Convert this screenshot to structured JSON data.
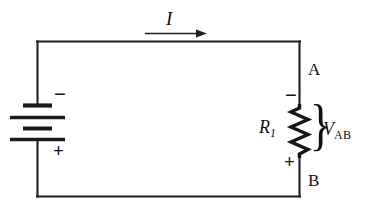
{
  "diagram": {
    "background_color": "#ffffff",
    "line_color": "#1a1a1a",
    "labels": {
      "current": "I",
      "node_a": "A",
      "node_b": "B",
      "resistor_name": "R",
      "resistor_subscript": "1",
      "voltage_name": "V",
      "voltage_subscript": "AB",
      "battery_negative": "−",
      "battery_positive": "+",
      "resistor_negative": "−",
      "resistor_positive": "+",
      "brace": "}"
    },
    "components": [
      {
        "name": "battery",
        "type": "dc-voltage-source",
        "orientation": "vertical",
        "plate_count": 4,
        "negative_terminal": "top",
        "positive_terminal": "bottom"
      },
      {
        "name": "resistor",
        "type": "zigzag-resistor",
        "orientation": "vertical",
        "label": "R1",
        "zigzag_peaks": 7,
        "negative_terminal": "top",
        "positive_terminal": "bottom"
      },
      {
        "name": "current-arrow",
        "type": "arrow",
        "direction": "right",
        "label": "I"
      },
      {
        "name": "voltage-brace",
        "type": "brace",
        "label": "VAB"
      }
    ],
    "wires": {
      "top": "left-top-corner to right-top-corner",
      "left": "battery branch",
      "right": "resistor branch",
      "bottom": "return path"
    }
  }
}
